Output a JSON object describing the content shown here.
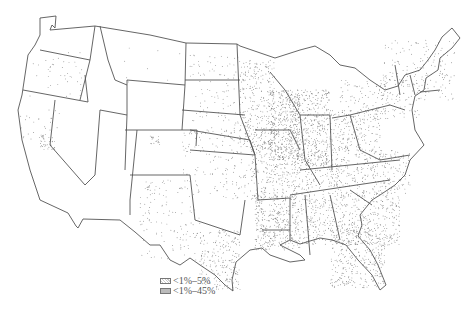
{
  "map": {
    "type": "dot-density / stipple map",
    "subject": "United States (contiguous 48 states)",
    "background": "#ffffff",
    "ink_color": "#555555",
    "density_levels": [
      {
        "level": "sparse",
        "regions": [
          "Oregon",
          "Washington (few)",
          "Idaho (few)",
          "Montana (few)",
          "Wyoming (few)",
          "Colorado",
          "New Mexico",
          "Arizona (few)",
          "Nevada (few)",
          "Utah (few)",
          "Dakotas",
          "Nebraska",
          "Kansas",
          "Oklahoma",
          "Texas (west/north)",
          "Minnesota",
          "Iowa",
          "Missouri",
          "New England",
          "New York",
          "Pennsylvania"
        ]
      },
      {
        "level": "clusters",
        "regions": [
          "Northern California (Central Valley)",
          "Southern California (Los Angeles area)",
          "Colorado (Denver area)",
          "New Mexico (central)"
        ]
      },
      {
        "level": "dense",
        "regions": [
          "Illinois",
          "Indiana",
          "Michigan (south)",
          "Ohio",
          "Mississippi River corridor",
          "Louisiana",
          "Mississippi",
          "Alabama",
          "Georgia",
          "South Carolina",
          "North Carolina",
          "Florida",
          "South Texas",
          "Kentucky",
          "Tennessee",
          "Arkansas"
        ]
      }
    ]
  },
  "legend": {
    "items": [
      {
        "label": "<1%–5%",
        "swatch": "light"
      },
      {
        "label": "<1%–45%",
        "swatch": "dense"
      }
    ]
  }
}
